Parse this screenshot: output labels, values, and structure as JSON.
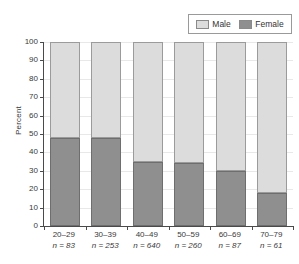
{
  "chart_data": {
    "type": "bar",
    "subtype": "stacked-100-percent",
    "title": "",
    "xlabel": "",
    "ylabel": "Percent",
    "ylim": [
      0,
      100
    ],
    "yticks": [
      0,
      10,
      20,
      30,
      40,
      50,
      60,
      70,
      80,
      90,
      100
    ],
    "grid": true,
    "legend_position": "top-right",
    "categories": [
      "20–29",
      "30–39",
      "40–49",
      "50–59",
      "60–69",
      "70–79"
    ],
    "category_sublabels": [
      "n = 83",
      "n = 253",
      "n = 640",
      "n = 260",
      "n = 87",
      "n = 61"
    ],
    "group_sizes": [
      83,
      253,
      640,
      260,
      87,
      61
    ],
    "series": [
      {
        "name": "Female",
        "color": "#8f8f8f",
        "values": [
          48,
          48,
          35,
          34,
          30,
          18
        ]
      },
      {
        "name": "Male",
        "color": "#dcdcdc",
        "values": [
          52,
          52,
          65,
          66,
          70,
          82
        ]
      }
    ]
  },
  "legend": {
    "items": [
      {
        "label": "Male",
        "swatch": "male"
      },
      {
        "label": "Female",
        "swatch": "female"
      }
    ]
  },
  "axes": {
    "y": {
      "label": "Percent",
      "ticks": [
        "0",
        "10",
        "20",
        "30",
        "40",
        "50",
        "60",
        "70",
        "80",
        "90",
        "100"
      ]
    }
  },
  "colors": {
    "male": "#dcdcdc",
    "female": "#8f8f8f",
    "axis": "#4a4a4a",
    "grid": "#e8e8e8",
    "text": "#3a3a3a"
  }
}
